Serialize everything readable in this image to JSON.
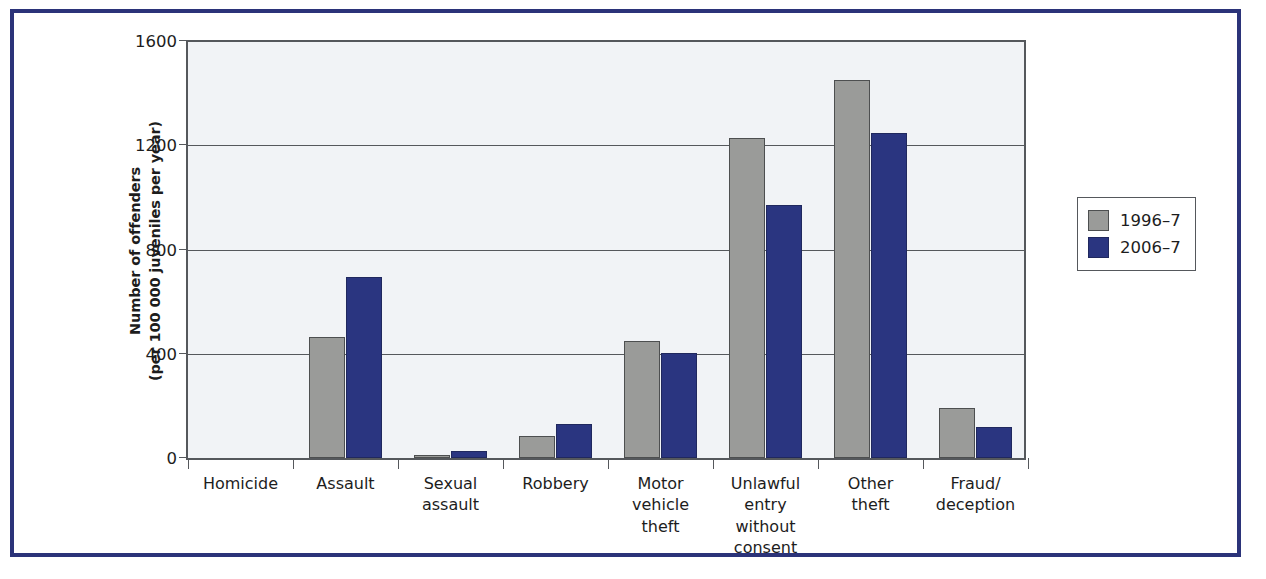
{
  "chart_data": {
    "type": "bar",
    "title": "",
    "xlabel": "",
    "ylabel": "Number of offenders\n(per 100 000 juveniles per year)",
    "ylabel_line1": "Number of offenders",
    "ylabel_line2": "(per 100 000 juveniles per year)",
    "ylim": [
      0,
      1600
    ],
    "yticks": [
      0,
      400,
      800,
      1200,
      1600
    ],
    "ytick_labels": [
      "0",
      "400",
      "800",
      "1200",
      "1600"
    ],
    "grid": true,
    "legend_position": "right",
    "categories": [
      "Homicide",
      "Assault",
      "Sexual assault",
      "Robbery",
      "Motor vehicle theft",
      "Unlawful entry without consent",
      "Other theft",
      "Fraud/ deception"
    ],
    "category_label_lines": [
      [
        "Homicide"
      ],
      [
        "Assault"
      ],
      [
        "Sexual",
        "assault"
      ],
      [
        "Robbery"
      ],
      [
        "Motor",
        "vehicle",
        "theft"
      ],
      [
        "Unlawful",
        "entry",
        "without",
        "consent"
      ],
      [
        "Other",
        "theft"
      ],
      [
        "Fraud/",
        "deception"
      ]
    ],
    "series": [
      {
        "name": "1996–7",
        "color": "#9a9b99",
        "values": [
          2,
          460,
          10,
          85,
          445,
          1220,
          1440,
          190
        ]
      },
      {
        "name": "2006–7",
        "color": "#2a3580",
        "values": [
          2,
          690,
          25,
          130,
          400,
          965,
          1240,
          120
        ]
      }
    ]
  },
  "legend": {
    "items": [
      {
        "label": "1996–7",
        "swatch": "series-1996-swatch"
      },
      {
        "label": "2006–7",
        "swatch": "series-2006-swatch"
      }
    ]
  },
  "colors": {
    "frame": "#2b3379",
    "series_1996": "#9a9b99",
    "series_2006": "#2a3580",
    "plot_background": "#f1f3f6",
    "axis": "#55585c"
  }
}
